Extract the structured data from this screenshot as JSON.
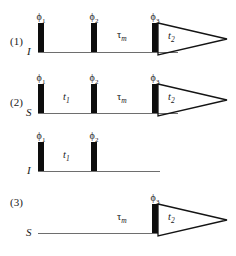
{
  "figure": {
    "type": "nmr-pulse-sequence-diagram",
    "background_color": "#ffffff",
    "pulse_color": "#0d0d0d",
    "line_color": "#6e6e6e",
    "text_color": "#1a1a1a"
  },
  "sequences": [
    {
      "number": "(1)",
      "channels": [
        {
          "label": "I",
          "pulses": [
            {
              "phase": "ϕ",
              "index": "1"
            },
            {
              "phase": "ϕ",
              "index": "2"
            },
            {
              "phase": "ϕ",
              "index": "3"
            }
          ],
          "intervals": [
            {
              "symbol": "τ",
              "index": "m",
              "kind": "mixing"
            },
            {
              "symbol": "t",
              "index": "2",
              "kind": "acquisition"
            }
          ],
          "has_fid": true
        }
      ]
    },
    {
      "number": "(2)",
      "channels": [
        {
          "label": "S",
          "pulses": [
            {
              "phase": "ϕ",
              "index": "1"
            },
            {
              "phase": "ϕ",
              "index": "2"
            },
            {
              "phase": "ϕ",
              "index": "3"
            }
          ],
          "intervals": [
            {
              "symbol": "t",
              "index": "1",
              "kind": "evolution"
            },
            {
              "symbol": "τ",
              "index": "m",
              "kind": "mixing"
            },
            {
              "symbol": "t",
              "index": "2",
              "kind": "acquisition"
            }
          ],
          "has_fid": true
        }
      ]
    },
    {
      "number": "(3)",
      "channels": [
        {
          "label": "I",
          "pulses": [
            {
              "phase": "ϕ",
              "index": "1"
            },
            {
              "phase": "ϕ",
              "index": "2"
            }
          ],
          "intervals": [
            {
              "symbol": "t",
              "index": "1",
              "kind": "evolution"
            }
          ],
          "has_fid": false
        },
        {
          "label": "S",
          "pulses": [
            {
              "phase": "ϕ",
              "index": "3"
            }
          ],
          "intervals": [
            {
              "symbol": "τ",
              "index": "m",
              "kind": "mixing"
            },
            {
              "symbol": "t",
              "index": "2",
              "kind": "acquisition"
            }
          ],
          "has_fid": true
        }
      ]
    }
  ],
  "labels": {
    "seq1_number": "(1)",
    "seq2_number": "(2)",
    "seq3_number": "(3)",
    "seq1_channel": "I",
    "seq2_channel": "S",
    "seq3_channel_i": "I",
    "seq3_channel_s": "S",
    "phi": "ϕ",
    "tau": "τ",
    "sub1": "1",
    "sub2": "2",
    "sub3": "3",
    "subm": "m",
    "t": "t"
  }
}
